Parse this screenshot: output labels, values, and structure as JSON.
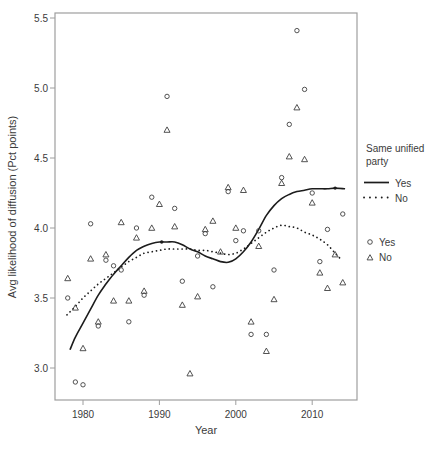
{
  "labels": {
    "xlabel": "Year",
    "ylabel": "Avg likelihood of diffusion (Pct points)"
  },
  "legend": {
    "title_line1": "Same unified",
    "title_line2": "party",
    "line_entries": [
      {
        "label": "Yes",
        "style": "solid"
      },
      {
        "label": "No",
        "style": "dotted"
      }
    ],
    "marker_entries": [
      {
        "label": "Yes",
        "marker": "circle"
      },
      {
        "label": "No",
        "marker": "triangle"
      }
    ]
  },
  "colors": {
    "curve": "#1c1c1c",
    "marker": "#3f3f3f",
    "axis_box": "#9e9e9e",
    "text": "#3b3b3b",
    "background": "#ffffff"
  },
  "chart_data": {
    "type": "scatter",
    "title": "",
    "xlabel": "Year",
    "ylabel": "Avg likelihood of diffusion (Pct points)",
    "xlim": [
      1976.3,
      2015.9
    ],
    "ylim": [
      2.77,
      5.54
    ],
    "x_ticks": [
      1980,
      1990,
      2000,
      2010
    ],
    "y_ticks": [
      3.0,
      3.5,
      4.0,
      4.5,
      5.0,
      5.5
    ],
    "grid": false,
    "legend_position": "right",
    "series": [
      {
        "name": "Yes",
        "role": "points",
        "marker": "circle",
        "points": [
          [
            1978,
            3.5
          ],
          [
            1979,
            2.9
          ],
          [
            1980,
            2.88
          ],
          [
            1981,
            4.03
          ],
          [
            1982,
            3.3
          ],
          [
            1983,
            3.77
          ],
          [
            1984,
            3.73
          ],
          [
            1985,
            3.7
          ],
          [
            1986,
            3.33
          ],
          [
            1987,
            4.0
          ],
          [
            1988,
            3.52
          ],
          [
            1989,
            4.22
          ],
          [
            1991,
            4.94
          ],
          [
            1992,
            4.14
          ],
          [
            1993,
            3.62
          ],
          [
            1995,
            3.8
          ],
          [
            1996,
            3.96
          ],
          [
            1997,
            3.58
          ],
          [
            1999,
            4.26
          ],
          [
            2000,
            3.91
          ],
          [
            2001,
            3.98
          ],
          [
            2002,
            3.24
          ],
          [
            2003,
            3.98
          ],
          [
            2004,
            3.24
          ],
          [
            2005,
            3.7
          ],
          [
            2006,
            4.36
          ],
          [
            2007,
            4.74
          ],
          [
            2008,
            5.41
          ],
          [
            2009,
            4.99
          ],
          [
            2010,
            4.25
          ],
          [
            2011,
            3.76
          ],
          [
            2012,
            3.99
          ],
          [
            2014,
            4.1
          ]
        ]
      },
      {
        "name": "No",
        "role": "points",
        "marker": "triangle",
        "points": [
          [
            1978,
            3.64
          ],
          [
            1979,
            3.43
          ],
          [
            1980,
            3.14
          ],
          [
            1981,
            3.78
          ],
          [
            1982,
            3.33
          ],
          [
            1983,
            3.81
          ],
          [
            1984,
            3.48
          ],
          [
            1985,
            4.04
          ],
          [
            1986,
            3.48
          ],
          [
            1987,
            3.93
          ],
          [
            1988,
            3.55
          ],
          [
            1989,
            4.0
          ],
          [
            1990,
            4.17
          ],
          [
            1991,
            4.7
          ],
          [
            1992,
            4.01
          ],
          [
            1993,
            3.45
          ],
          [
            1994,
            2.96
          ],
          [
            1995,
            3.51
          ],
          [
            1996,
            3.99
          ],
          [
            1997,
            4.05
          ],
          [
            1998,
            3.83
          ],
          [
            1999,
            4.29
          ],
          [
            2000,
            4.0
          ],
          [
            2001,
            4.27
          ],
          [
            2002,
            3.33
          ],
          [
            2003,
            3.87
          ],
          [
            2004,
            3.12
          ],
          [
            2005,
            3.49
          ],
          [
            2006,
            4.32
          ],
          [
            2007,
            4.51
          ],
          [
            2008,
            4.86
          ],
          [
            2009,
            4.49
          ],
          [
            2010,
            4.18
          ],
          [
            2011,
            3.68
          ],
          [
            2012,
            3.57
          ],
          [
            2013,
            3.81
          ],
          [
            2014,
            3.61
          ]
        ]
      },
      {
        "name": "Yes",
        "role": "smooth",
        "style": "solid",
        "points": [
          [
            1978.3,
            3.13
          ],
          [
            1979,
            3.22
          ],
          [
            1980,
            3.32
          ],
          [
            1981,
            3.42
          ],
          [
            1982,
            3.52
          ],
          [
            1983,
            3.6
          ],
          [
            1984,
            3.67
          ],
          [
            1985,
            3.73
          ],
          [
            1986,
            3.79
          ],
          [
            1987,
            3.84
          ],
          [
            1988,
            3.87
          ],
          [
            1989,
            3.89
          ],
          [
            1990,
            3.9
          ],
          [
            1991,
            3.9
          ],
          [
            1992,
            3.9
          ],
          [
            1993,
            3.88
          ],
          [
            1994,
            3.85
          ],
          [
            1995,
            3.83
          ],
          [
            1996,
            3.8
          ],
          [
            1997,
            3.78
          ],
          [
            1998,
            3.76
          ],
          [
            1999,
            3.755
          ],
          [
            2000,
            3.78
          ],
          [
            2001,
            3.83
          ],
          [
            2002,
            3.9
          ],
          [
            2003,
            3.99
          ],
          [
            2004,
            4.09
          ],
          [
            2005,
            4.16
          ],
          [
            2006,
            4.21
          ],
          [
            2007,
            4.24
          ],
          [
            2008,
            4.26
          ],
          [
            2009,
            4.27
          ],
          [
            2010,
            4.28
          ],
          [
            2011,
            4.28
          ],
          [
            2012,
            4.28
          ],
          [
            2013,
            4.285
          ],
          [
            2014.3,
            4.28
          ]
        ]
      },
      {
        "name": "No",
        "role": "smooth",
        "style": "dotted",
        "points": [
          [
            1977.9,
            3.38
          ],
          [
            1979,
            3.44
          ],
          [
            1980,
            3.5
          ],
          [
            1981,
            3.55
          ],
          [
            1982,
            3.6
          ],
          [
            1983,
            3.64
          ],
          [
            1984,
            3.68
          ],
          [
            1985,
            3.72
          ],
          [
            1986,
            3.76
          ],
          [
            1987,
            3.79
          ],
          [
            1988,
            3.82
          ],
          [
            1989,
            3.83
          ],
          [
            1990,
            3.84
          ],
          [
            1991,
            3.85
          ],
          [
            1992,
            3.85
          ],
          [
            1993,
            3.85
          ],
          [
            1994,
            3.85
          ],
          [
            1995,
            3.84
          ],
          [
            1996,
            3.84
          ],
          [
            1997,
            3.83
          ],
          [
            1998,
            3.82
          ],
          [
            1999,
            3.81
          ],
          [
            2000,
            3.82
          ],
          [
            2001,
            3.85
          ],
          [
            2002,
            3.89
          ],
          [
            2003,
            3.93
          ],
          [
            2004,
            3.97
          ],
          [
            2005,
            4.0
          ],
          [
            2006,
            4.02
          ],
          [
            2007,
            4.01
          ],
          [
            2008,
            4.0
          ],
          [
            2009,
            3.97
          ],
          [
            2010,
            3.95
          ],
          [
            2011,
            3.92
          ],
          [
            2012,
            3.88
          ],
          [
            2013,
            3.82
          ],
          [
            2013.7,
            3.78
          ]
        ]
      }
    ],
    "emphasis_dots": [
      [
        1990.3,
        3.9
      ],
      [
        2013.0,
        4.285
      ]
    ]
  }
}
